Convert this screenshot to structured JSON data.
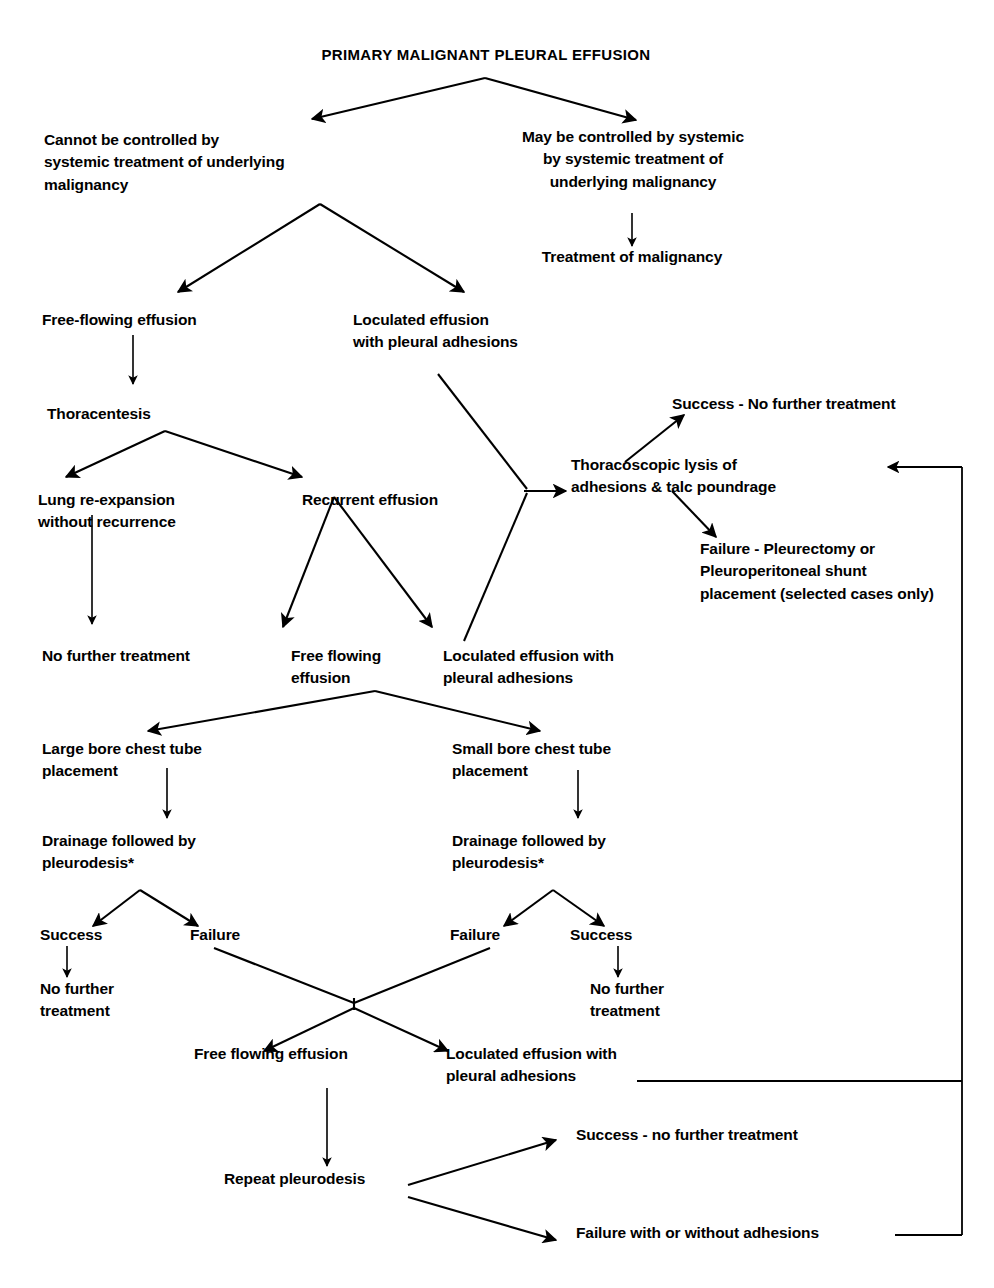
{
  "diagram": {
    "title": "PRIMARY MALIGNANT PLEURAL EFFUSION",
    "type": "clinical-management-flowchart",
    "footnote_marker": "*"
  },
  "nodes": {
    "title": "PRIMARY MALIGNANT PLEURAL EFFUSION",
    "cannot_control": "Cannot be controlled by\nsystemic treatment of  underlying\nmalignancy",
    "may_control": "May be controlled by systemic\nby systemic treatment of\nunderlying malignancy",
    "treatment_of_malignancy": "Treatment of malignancy",
    "free_flowing_effusion_1": "Free-flowing effusion",
    "loculated_effusion_1": "Loculated effusion\nwith pleural adhesions",
    "thoracentesis": "Thoracentesis",
    "lung_reexpansion": "Lung re-expansion\nwithout recurrence",
    "recurrent_effusion": "Recurrent effusion",
    "thoracoscopic_lysis": "Thoracoscopic lysis of\nadhesions & talc poundrage",
    "lysis_success": "Success - No further treatment",
    "lysis_failure": "Failure - Pleurectomy or\nPleuroperitoneal shunt\nplacement (selected cases only)",
    "no_further_treatment_1": "No further treatment",
    "free_flowing_effusion_2": "Free flowing\neffusion",
    "loculated_effusion_2": "Loculated effusion with\npleural adhesions",
    "large_bore": "Large bore chest tube\nplacement",
    "small_bore": "Small bore chest tube\nplacement",
    "drainage_left": "Drainage followed by\npleurodesis*",
    "drainage_right": "Drainage followed by\npleurodesis*",
    "success_left": "Success",
    "failure_left": "Failure",
    "failure_right": "Failure",
    "success_right": "Success",
    "no_further_treatment_left": "No further\ntreatment",
    "no_further_treatment_right": "No further\ntreatment",
    "free_flowing_effusion_3": "Free flowing effusion",
    "loculated_effusion_3": "Loculated effusion with\npleural adhesions",
    "repeat_pleurodesis": "Repeat pleurodesis",
    "repeat_success": "Success - no further treatment",
    "repeat_failure": "Failure with or without  adhesions"
  },
  "colors": {
    "ink": "#000000",
    "background": "#ffffff"
  }
}
